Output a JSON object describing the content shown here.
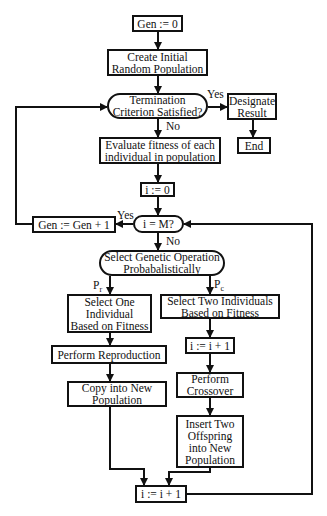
{
  "nodes": {
    "gen_init": {
      "lines": [
        "Gen := 0"
      ]
    },
    "create_pop": {
      "lines": [
        "Create Initial",
        "Random Population"
      ]
    },
    "termination": {
      "lines": [
        "Termination",
        "Criterion Satisfied?"
      ]
    },
    "designate": {
      "lines": [
        "Designate",
        "Result"
      ]
    },
    "end": {
      "lines": [
        "End"
      ]
    },
    "evaluate": {
      "lines": [
        "Evaluate fitness of each",
        "individual in population"
      ]
    },
    "i_init": {
      "lines": [
        "i := 0"
      ]
    },
    "i_check": {
      "lines": [
        "i = M?"
      ]
    },
    "gen_inc": {
      "lines": [
        "Gen := Gen + 1"
      ]
    },
    "select_op": {
      "lines": [
        "Select Genetic Operation",
        "Probabalistically"
      ]
    },
    "select_one": {
      "lines": [
        "Select One",
        "Individual",
        "Based on Fitness"
      ]
    },
    "select_two": {
      "lines": [
        "Select Two Individuals",
        "Based on Fitness"
      ]
    },
    "i_inc_cross": {
      "lines": [
        "i := i + 1"
      ]
    },
    "reproduction": {
      "lines": [
        "Perform Reproduction"
      ]
    },
    "copy": {
      "lines": [
        "Copy into New",
        "Population"
      ]
    },
    "crossover": {
      "lines": [
        "Perform",
        "Crossover"
      ]
    },
    "insert": {
      "lines": [
        "Insert Two",
        "Offspring",
        "into New",
        "Population"
      ]
    },
    "i_inc_final": {
      "lines": [
        "i := i + 1"
      ]
    }
  },
  "labels": {
    "term_yes": "Yes",
    "term_no": "No",
    "icheck_yes": "Yes",
    "icheck_no": "No",
    "pr_main": "P",
    "pr_sub": "r",
    "pc_main": "P",
    "pc_sub": "c"
  }
}
